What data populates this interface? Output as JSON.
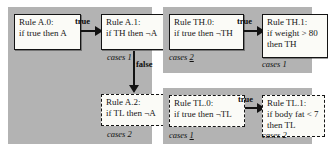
{
  "diagram": {
    "panel_background": "#b3b3b3",
    "box_background": "#fbfbf7",
    "line_color": "#131313",
    "panels": [
      {
        "id": "panel-a",
        "nodes": [
          {
            "id": "rule-a0",
            "border": "solid",
            "lines": [
              "Rule A.0:",
              "if true then A"
            ],
            "case_label": null
          },
          {
            "id": "rule-a1",
            "border": "solid",
            "lines": [
              "Rule A.1:",
              "if TH then ¬A"
            ],
            "case_label": {
              "word": "cases",
              "number": "1",
              "underlined": false
            }
          },
          {
            "id": "rule-a2",
            "border": "dashed",
            "lines": [
              "Rule A.2:",
              "if TL then ¬A"
            ],
            "case_label": {
              "word": "cases",
              "number": "2",
              "underlined": false
            }
          }
        ],
        "edges": [
          {
            "id": "edge-a0-a1",
            "label": "true",
            "direction": "right"
          },
          {
            "id": "edge-a1-a2",
            "label": "false",
            "direction": "down"
          }
        ]
      },
      {
        "id": "panel-th",
        "nodes": [
          {
            "id": "rule-th0",
            "border": "solid",
            "lines": [
              "Rule TH.0:",
              "if true then ¬TH"
            ],
            "case_label": {
              "word": "cases",
              "number": "2",
              "underlined": true
            }
          },
          {
            "id": "rule-th1",
            "border": "solid",
            "lines": [
              "Rule TH.1:",
              "if weight > 80",
              "then TH"
            ],
            "case_label": {
              "word": "cases",
              "number": "1",
              "underlined": false
            }
          }
        ],
        "edges": [
          {
            "id": "edge-th0-th1",
            "label": "true",
            "direction": "right"
          }
        ]
      },
      {
        "id": "panel-tl",
        "nodes": [
          {
            "id": "rule-tl0",
            "border": "dashed",
            "lines": [
              "Rule TL.0:",
              "if true then ¬TL"
            ],
            "case_label": {
              "word": "cases",
              "number": "1",
              "underlined": true
            }
          },
          {
            "id": "rule-tl1",
            "border": "dashed",
            "lines": [
              "Rule TL.1:",
              "if body fat < 7",
              "then TL"
            ],
            "case_label": {
              "word": "cases",
              "number": "2",
              "underlined": false
            }
          }
        ],
        "edges": [
          {
            "id": "edge-tl0-tl1",
            "label": "true",
            "direction": "right"
          }
        ]
      }
    ]
  }
}
